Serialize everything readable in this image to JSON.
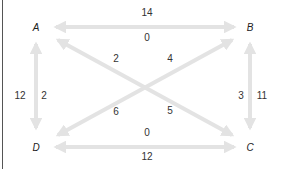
{
  "diagram": {
    "nodes": [
      {
        "id": "A",
        "label": "A",
        "x": 36,
        "y": 27
      },
      {
        "id": "B",
        "label": "B",
        "x": 250,
        "y": 27
      },
      {
        "id": "C",
        "label": "C",
        "x": 250,
        "y": 147
      },
      {
        "id": "D",
        "label": "D",
        "x": 36,
        "y": 147
      }
    ],
    "edges": [
      {
        "pair": "A-B",
        "weights": [
          {
            "label": "14",
            "x": 147,
            "y": 12
          },
          {
            "label": "0",
            "x": 147,
            "y": 37
          }
        ]
      },
      {
        "pair": "D-C",
        "weights": [
          {
            "label": "0",
            "x": 147,
            "y": 132
          },
          {
            "label": "12",
            "x": 147,
            "y": 156
          }
        ]
      },
      {
        "pair": "A-D",
        "weights": [
          {
            "label": "12",
            "x": 20,
            "y": 95
          },
          {
            "label": "2",
            "x": 44,
            "y": 95
          }
        ]
      },
      {
        "pair": "B-C",
        "weights": [
          {
            "label": "3",
            "x": 241,
            "y": 95
          },
          {
            "label": "11",
            "x": 262,
            "y": 95
          }
        ]
      },
      {
        "pair": "A-C",
        "weights": [
          {
            "label": "2",
            "x": 116,
            "y": 58
          },
          {
            "label": "5",
            "x": 170,
            "y": 110
          }
        ]
      },
      {
        "pair": "B-D",
        "weights": [
          {
            "label": "4",
            "x": 170,
            "y": 58
          },
          {
            "label": "6",
            "x": 116,
            "y": 111
          }
        ]
      }
    ],
    "colors": {
      "arrow": "#e3e3e3",
      "text": "#333333",
      "rule": "#555555"
    }
  }
}
